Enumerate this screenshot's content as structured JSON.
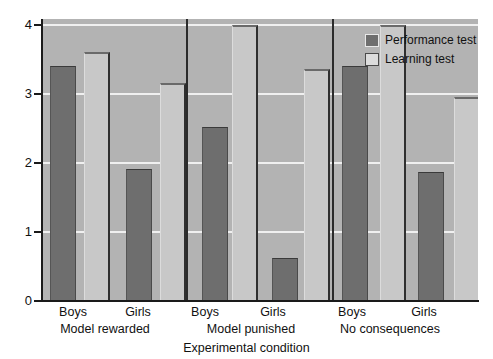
{
  "chart_data": {
    "type": "bar",
    "title": "",
    "xlabel": "Experimental condition",
    "ylabel": "",
    "ylim": [
      0,
      4
    ],
    "yticks": [
      "0",
      "1",
      "2",
      "3",
      "4"
    ],
    "grid": true,
    "legend_position": "top-right",
    "categories": [
      "Boys",
      "Girls",
      "Boys",
      "Girls",
      "Boys",
      "Girls"
    ],
    "groups": [
      {
        "label": "Model rewarded",
        "bars": [
          {
            "category": "Boys",
            "performance": 3.4,
            "learning": 3.6
          },
          {
            "category": "Girls",
            "performance": 1.9,
            "learning": 3.15
          }
        ]
      },
      {
        "label": "Model punished",
        "bars": [
          {
            "category": "Boys",
            "performance": 2.5,
            "learning": 4.0
          },
          {
            "category": "Girls",
            "performance": 0.6,
            "learning": 3.35
          }
        ]
      },
      {
        "label": "No consequences",
        "bars": [
          {
            "category": "Boys",
            "performance": 3.4,
            "learning": 4.0
          },
          {
            "category": "Girls",
            "performance": 1.85,
            "learning": 2.95
          }
        ]
      }
    ],
    "series": [
      {
        "name": "Performance test",
        "color": "#6e6e6e",
        "values": [
          3.4,
          1.9,
          2.5,
          0.6,
          3.4,
          1.85
        ]
      },
      {
        "name": "Learning test",
        "color": "#c8c8c8",
        "values": [
          3.6,
          3.15,
          4.0,
          3.35,
          4.0,
          2.95
        ]
      }
    ]
  },
  "legend": {
    "items": [
      {
        "label": "Performance test",
        "swatch": "performance"
      },
      {
        "label": "Learning test",
        "swatch": "learning"
      }
    ]
  },
  "colors": {
    "plot_background": "#b3b3b3",
    "gridline": "#f0f0f0",
    "performance_bar": "#6e6e6e",
    "learning_bar": "#c8c8c8",
    "axis": "#1a1a1a",
    "page_background": "#ffffff"
  }
}
